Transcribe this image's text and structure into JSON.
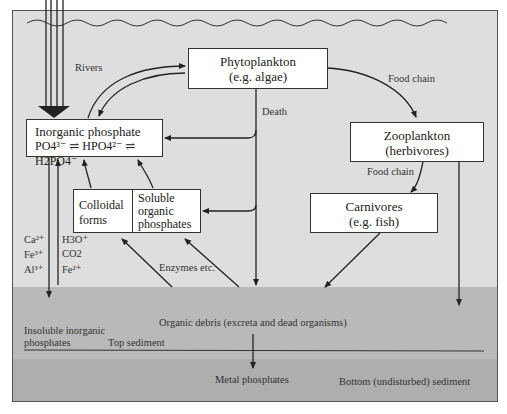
{
  "diagram": {
    "nodes": {
      "phytoplankton": {
        "line1": "Phytoplankton",
        "line2": "(e.g. algae)"
      },
      "inorganic": {
        "line1": "Inorganic phosphate",
        "line2": "PO4³⁻ ⇌ HPO4²⁻ ⇌ H2PO4⁻"
      },
      "colloidal": {
        "line1": "Colloidal",
        "line2": "forms"
      },
      "soluble": {
        "line1": "Soluble",
        "line2": "organic",
        "line3": "phosphates"
      },
      "zooplankton": {
        "line1": "Zooplankton",
        "line2": "(herbivores)"
      },
      "carnivores": {
        "line1": "Carnivores",
        "line2": "(e.g. fish)"
      }
    },
    "labels": {
      "rivers": "Rivers",
      "death": "Death",
      "food_chain_1": "Food chain",
      "food_chain_2": "Food chain",
      "enzymes": "Enzymes etc.",
      "ions_left": [
        "Ca²⁺",
        "Fe³⁺",
        "Al³⁺"
      ],
      "ions_right": [
        "H3O⁺",
        "CO2",
        "Fe²⁺"
      ],
      "organic_debris": "Organic debris (excreta and dead organisms)",
      "insoluble_1": "Insoluble inorganic",
      "insoluble_2": "phosphates",
      "top_sediment": "Top sediment",
      "metal_phosphates": "Metal phosphates",
      "bottom_sediment": "Bottom (undisturbed) sediment"
    },
    "colors": {
      "water": "#dedede",
      "top_sediment": "#b9b9b9",
      "bottom_sediment": "#aeaeae",
      "line": "#222222"
    }
  }
}
